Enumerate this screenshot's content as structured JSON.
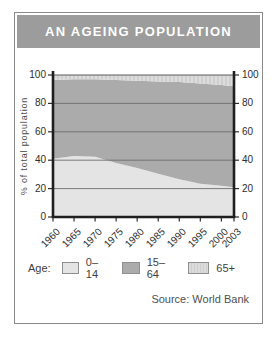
{
  "title": "AN AGEING POPULATION",
  "source": "Source: World Bank",
  "legend": {
    "label": "Age:",
    "items": [
      {
        "label": "0–14",
        "fill": "#e4e4e4"
      },
      {
        "label": "15–64",
        "fill": "#ababab"
      },
      {
        "label": "65+",
        "fill": "hatch"
      }
    ]
  },
  "colors": {
    "banner_bg": "#9c9c9c",
    "banner_text": "#ffffff",
    "axis": "#1f1f1f",
    "grid": "#6e6e6e",
    "top_line": "#5a5a5a",
    "tick": "#2e2e2e",
    "hatch_base": "#dcdcdc",
    "hatch_stripe": "#cfcfcf"
  },
  "chart_data": {
    "type": "area",
    "stacked": true,
    "title": "AN AGEING POPULATION",
    "x": [
      1960,
      1965,
      1970,
      1975,
      1980,
      1985,
      1990,
      1995,
      2000,
      2003
    ],
    "x_tick_labels": [
      "1960",
      "1965",
      "1970",
      "1975",
      "1980",
      "1985",
      "1990",
      "1995",
      "2000",
      "2003"
    ],
    "series": [
      {
        "name": "0–14",
        "values": [
          41,
          43,
          42.5,
          38,
          34.5,
          30.5,
          26.5,
          23.5,
          22,
          21
        ],
        "fill": "#e4e4e4"
      },
      {
        "name": "15–64",
        "values": [
          55.5,
          54,
          54.5,
          58.5,
          61.5,
          65,
          68.5,
          70.5,
          71,
          71
        ],
        "fill": "#ababab"
      },
      {
        "name": "65+",
        "values": [
          3.5,
          3,
          3,
          3.5,
          4,
          4.5,
          5,
          6,
          7,
          8
        ],
        "fill": "hatch"
      }
    ],
    "ylabel": "% of total population",
    "xlabel": "",
    "ylim": [
      0,
      100
    ],
    "y_ticks": [
      0,
      20,
      40,
      60,
      80,
      100
    ],
    "grid": true,
    "legend_position": "bottom"
  }
}
